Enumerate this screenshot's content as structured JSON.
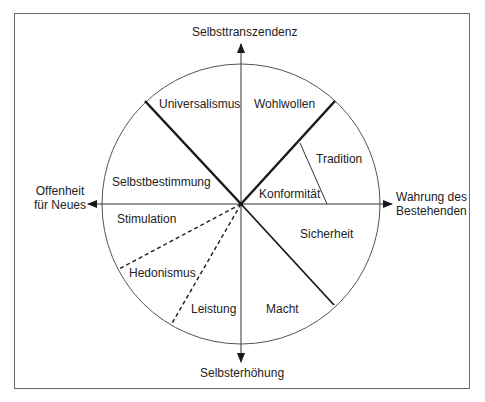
{
  "diagram": {
    "type": "circular value model",
    "axes": {
      "top": "Selbsttranszendenz",
      "bottom": "Selbsterhöhung",
      "left_line1": "Offenheit",
      "left_line2": "für Neues",
      "right_line1": "Wahrung des",
      "right_line2": "Bestehenden"
    },
    "segments": [
      {
        "label": "Universalismus"
      },
      {
        "label": "Wohlwollen"
      },
      {
        "label": "Tradition"
      },
      {
        "label": "Konformität"
      },
      {
        "label": "Sicherheit"
      },
      {
        "label": "Macht"
      },
      {
        "label": "Leistung"
      },
      {
        "label": "Hedonismus"
      },
      {
        "label": "Stimulation"
      },
      {
        "label": "Selbstbestimmung"
      }
    ],
    "colors": {
      "line": "#1a1a1a",
      "circle": "#555555",
      "frame": "#6a6a6a",
      "background": "#ffffff"
    }
  }
}
